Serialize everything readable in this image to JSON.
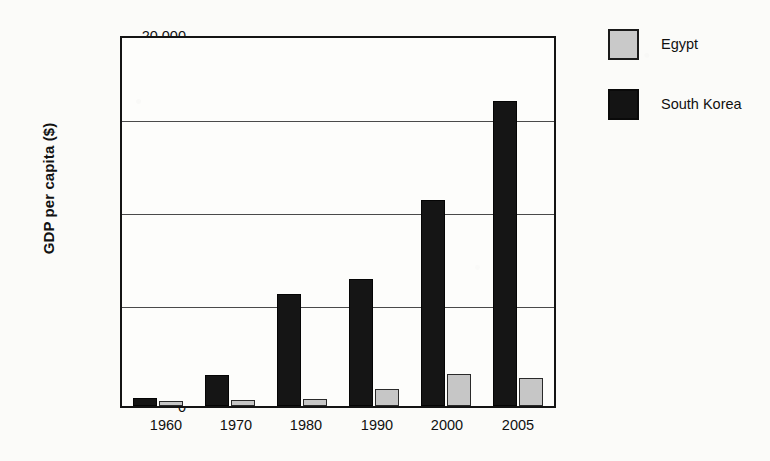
{
  "chart_data": {
    "type": "bar",
    "title": "",
    "xlabel": "",
    "ylabel": "GDP per capita ($)",
    "categories": [
      "1960",
      "1970",
      "1980",
      "1990",
      "2000",
      "2005"
    ],
    "series": [
      {
        "name": "South Korea",
        "color": "#151515",
        "values": [
          430,
          1700,
          6100,
          6900,
          11200,
          16600
        ]
      },
      {
        "name": "Egypt",
        "color": "#c6c6c6",
        "values": [
          270,
          300,
          400,
          900,
          1750,
          1500
        ]
      }
    ],
    "series_draw_order": [
      "South Korea",
      "Egypt"
    ],
    "ylim": [
      0,
      20000
    ],
    "ytick_values": [
      0,
      5000,
      10000,
      15000,
      20000
    ],
    "ytick_labels": [
      "0",
      "5,000",
      "10,000",
      "15,000",
      "20,000"
    ],
    "grid": true,
    "grid_axis": "y",
    "legend_position": "top-right",
    "legend_entries": [
      {
        "label": "Egypt",
        "color": "#c9c9c9",
        "swatch": "gray-square"
      },
      {
        "label": "South Korea",
        "color": "#141414",
        "swatch": "black-square"
      }
    ]
  }
}
